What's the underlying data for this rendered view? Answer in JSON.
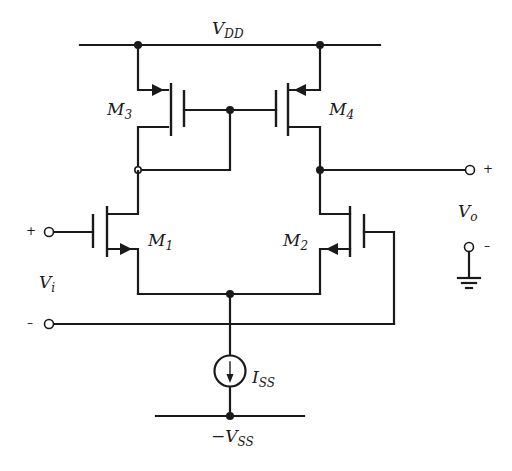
{
  "diagram": {
    "type": "circuit-schematic",
    "labels": {
      "vdd": {
        "main": "V",
        "sub": "DD"
      },
      "vss": {
        "main": "−V",
        "sub": "SS"
      },
      "iss": {
        "main": "I",
        "sub": "SS"
      },
      "m1": {
        "main": "M",
        "sub": "1"
      },
      "m2": {
        "main": "M",
        "sub": "2"
      },
      "m3": {
        "main": "M",
        "sub": "3"
      },
      "m4": {
        "main": "M",
        "sub": "4"
      },
      "vi": {
        "main": "V",
        "sub": "i"
      },
      "vo": {
        "main": "V",
        "sub": "o"
      }
    },
    "signs": {
      "vi_plus": "+",
      "vi_minus": "–",
      "vo_plus": "+",
      "vo_minus": "–"
    },
    "components": [
      {
        "id": "M1",
        "kind": "NMOS",
        "role": "input transistor (+ input)"
      },
      {
        "id": "M2",
        "kind": "NMOS",
        "role": "input transistor (− input)"
      },
      {
        "id": "M3",
        "kind": "PMOS",
        "role": "current-mirror load (diode-connected)"
      },
      {
        "id": "M4",
        "kind": "PMOS",
        "role": "current-mirror load (output side)"
      },
      {
        "id": "ISS",
        "kind": "current source",
        "role": "tail current"
      }
    ],
    "nodes": [
      "VDD",
      "-VSS",
      "Vi+",
      "Vi-",
      "Vo+",
      "Vo- (ground)"
    ],
    "colors": {
      "ink": "#1a1a1a",
      "background": "#ffffff"
    }
  }
}
